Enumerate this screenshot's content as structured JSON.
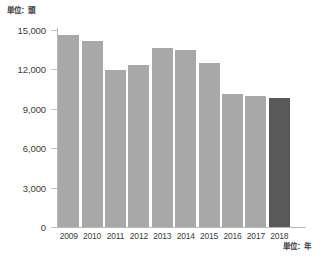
{
  "labels": {
    "unit_y": "単位：頭",
    "unit_x": "単位：年"
  },
  "chart_data": {
    "type": "bar",
    "title": "",
    "xlabel": "単位：年",
    "ylabel": "単位：頭",
    "categories": [
      "2009",
      "2010",
      "2011",
      "2012",
      "2013",
      "2014",
      "2015",
      "2016",
      "2017",
      "2018"
    ],
    "values": [
      14600,
      14150,
      11950,
      12300,
      13600,
      13500,
      12500,
      10150,
      9950,
      9800
    ],
    "ylim": [
      0,
      15000
    ],
    "yticks": [
      0,
      3000,
      6000,
      9000,
      12000,
      15000
    ],
    "ytick_labels": [
      "0",
      "3,000",
      "6,000",
      "9,000",
      "12,000",
      "15,000"
    ],
    "grid": false,
    "legend": "none",
    "series": [
      {
        "name": "頭数",
        "values": [
          14600,
          14150,
          11950,
          12300,
          13600,
          13500,
          12500,
          10150,
          9950,
          9800
        ]
      }
    ],
    "colors": {
      "bar": "#a8a8a8",
      "bar_highlight": "#595959",
      "axis": "#b9b9b9",
      "text": "#3d3d3d",
      "background": "#ffffff"
    },
    "highlight_index": 9
  }
}
